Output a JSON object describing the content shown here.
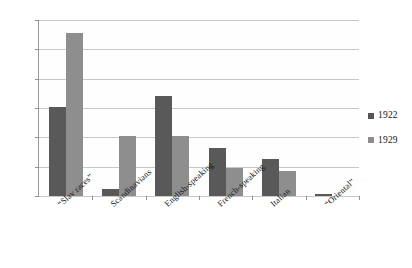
{
  "chart_data": {
    "type": "bar",
    "title": "",
    "subtitle": "",
    "xlabel": "",
    "ylabel": "",
    "ylim": [
      0,
      60
    ],
    "ytick_labels": [
      "0%",
      "10%",
      "20%",
      "30%",
      "40%",
      "50%",
      "60%"
    ],
    "ytick_values": [
      0,
      10,
      20,
      30,
      40,
      50,
      60
    ],
    "grid": true,
    "legend_position": "right",
    "categories": [
      "“Slav races”",
      "Scandinavians",
      "English-speaking",
      "French-speaking",
      "Italian",
      "“Oriental”"
    ],
    "series": [
      {
        "name": "1922",
        "color": "#595959",
        "values": [
          30.5,
          2.5,
          34.0,
          16.5,
          12.5,
          0.8
        ]
      },
      {
        "name": "1929",
        "color": "#8e8e8e",
        "values": [
          55.5,
          20.5,
          20.5,
          9.5,
          8.5,
          0.0
        ]
      }
    ]
  },
  "legend": {
    "items": [
      {
        "label": "1922",
        "swatch": "legend-swatch-1922"
      },
      {
        "label": "1929",
        "swatch": "legend-swatch-1929"
      }
    ]
  },
  "axis": {
    "y_labels": [
      "60%",
      "50%",
      "40%",
      "30%",
      "20%",
      "10%",
      "0%"
    ]
  },
  "colors": {
    "series_1922": "#595959",
    "series_1929": "#8e8e8e",
    "gridline": "#c9c9c9",
    "axis": "#9a9a9a",
    "text": "#141414",
    "background": "#ffffff"
  }
}
